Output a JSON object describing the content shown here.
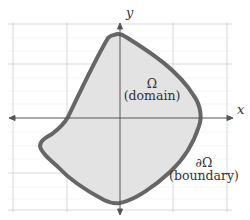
{
  "diagram": {
    "title": "",
    "axes": {
      "x_label": "x",
      "y_label": "y",
      "color": "#555555"
    },
    "grid": {
      "color": "#cfcfcf",
      "vertical_lines_px": [
        13,
        67,
        173,
        227
      ],
      "horizontal_lines_px": [
        24,
        64,
        173,
        210
      ]
    },
    "region": {
      "symbol": "Ω",
      "label": "(domain)",
      "fill": "#e3e3e3"
    },
    "boundary": {
      "symbol": "∂Ω",
      "label": "(boundary)",
      "stroke": "#666666",
      "stroke_width": 4
    }
  }
}
